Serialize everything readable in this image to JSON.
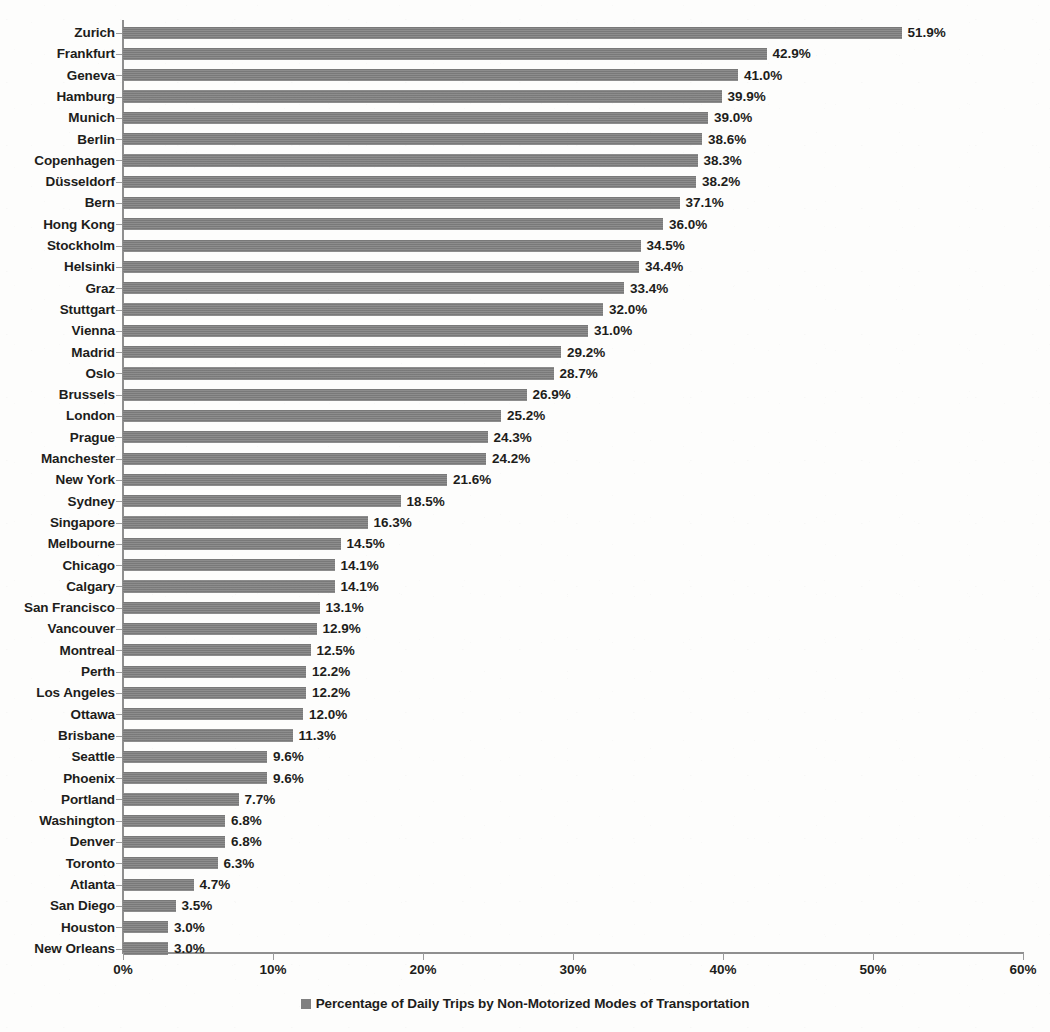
{
  "chart_data": {
    "type": "bar",
    "orientation": "horizontal",
    "title": "",
    "xlabel": "",
    "ylabel": "",
    "xlim": [
      0,
      60
    ],
    "grid": false,
    "legend_position": "bottom",
    "legend": [
      "Percentage of Daily Trips by Non-Motorized Modes of Transportation"
    ],
    "series_name": "Percentage of Daily Trips by Non-Motorized Modes of Transportation",
    "bar_color": "#808080",
    "xticks": [
      "0%",
      "10%",
      "20%",
      "30%",
      "40%",
      "50%",
      "60%"
    ],
    "xtick_values": [
      0,
      10,
      20,
      30,
      40,
      50,
      60
    ],
    "categories": [
      "Zurich",
      "Frankfurt",
      "Geneva",
      "Hamburg",
      "Munich",
      "Berlin",
      "Copenhagen",
      "Düsseldorf",
      "Bern",
      "Hong Kong",
      "Stockholm",
      "Helsinki",
      "Graz",
      "Stuttgart",
      "Vienna",
      "Madrid",
      "Oslo",
      "Brussels",
      "London",
      "Prague",
      "Manchester",
      "New York",
      "Sydney",
      "Singapore",
      "Melbourne",
      "Chicago",
      "Calgary",
      "San Francisco",
      "Vancouver",
      "Montreal",
      "Perth",
      "Los Angeles",
      "Ottawa",
      "Brisbane",
      "Seattle",
      "Phoenix",
      "Portland",
      "Washington",
      "Denver",
      "Toronto",
      "Atlanta",
      "San Diego",
      "Houston",
      "New Orleans"
    ],
    "values": [
      51.9,
      42.9,
      41.0,
      39.9,
      39.0,
      38.6,
      38.3,
      38.2,
      37.1,
      36.0,
      34.5,
      34.4,
      33.4,
      32.0,
      31.0,
      29.2,
      28.7,
      26.9,
      25.2,
      24.3,
      24.2,
      21.6,
      18.5,
      16.3,
      14.5,
      14.1,
      14.1,
      13.1,
      12.9,
      12.5,
      12.2,
      12.2,
      12.0,
      11.3,
      9.6,
      9.6,
      7.7,
      6.8,
      6.8,
      6.3,
      4.7,
      3.5,
      3.0,
      3.0
    ],
    "data_labels": [
      "51.9%",
      "42.9%",
      "41.0%",
      "39.9%",
      "39.0%",
      "38.6%",
      "38.3%",
      "38.2%",
      "37.1%",
      "36.0%",
      "34.5%",
      "34.4%",
      "33.4%",
      "32.0%",
      "31.0%",
      "29.2%",
      "28.7%",
      "26.9%",
      "25.2%",
      "24.3%",
      "24.2%",
      "21.6%",
      "18.5%",
      "16.3%",
      "14.5%",
      "14.1%",
      "14.1%",
      "13.1%",
      "12.9%",
      "12.5%",
      "12.2%",
      "12.2%",
      "12.0%",
      "11.3%",
      "9.6%",
      "9.6%",
      "7.7%",
      "6.8%",
      "6.8%",
      "6.3%",
      "4.7%",
      "3.5%",
      "3.0%",
      "3.0%"
    ]
  }
}
